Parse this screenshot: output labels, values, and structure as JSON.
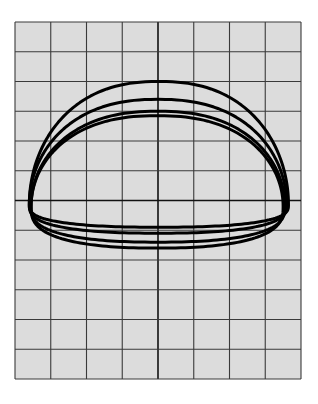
{
  "chart_data": {
    "type": "line",
    "title": "",
    "xlabel": "",
    "ylabel": "",
    "grid": true,
    "legend": null,
    "grid_columns": 8,
    "grid_rows": 12,
    "xlim": [
      -4,
      4
    ],
    "ylim": [
      -6,
      6
    ],
    "plot_area_px": {
      "left": 15,
      "top": 22,
      "right": 301,
      "bottom": 379
    },
    "colors": {
      "background": "#dcdcdc",
      "grid": "#3a3a3a",
      "axis": "#111111",
      "curve": "#000000",
      "page": "#ffffff"
    },
    "series": [
      {
        "name": "loop-1",
        "left_x": -3.6,
        "right_x": 3.65,
        "center_y": -0.15,
        "top_y": 4.0,
        "bottom_y": -0.9
      },
      {
        "name": "loop-2",
        "left_x": -3.6,
        "right_x": 3.6,
        "center_y": -0.15,
        "top_y": 3.4,
        "bottom_y": -1.1
      },
      {
        "name": "loop-3",
        "left_x": -3.55,
        "right_x": 3.55,
        "center_y": -0.2,
        "top_y": 3.0,
        "bottom_y": -1.4
      },
      {
        "name": "loop-4",
        "left_x": -3.55,
        "right_x": 3.5,
        "center_y": -0.2,
        "top_y": 2.85,
        "bottom_y": -1.6
      }
    ]
  }
}
